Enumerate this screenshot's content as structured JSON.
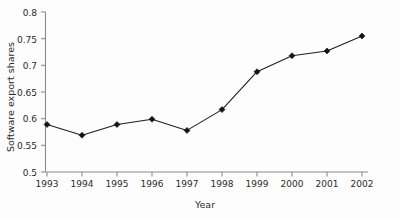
{
  "chart_data": {
    "type": "line",
    "title": "",
    "subtitle": "",
    "xlabel": "Year",
    "ylabel": "Software export shares",
    "x": [
      1993,
      1994,
      1995,
      1996,
      1997,
      1998,
      1999,
      2000,
      2001,
      2002
    ],
    "categories": [
      "1993",
      "1994",
      "1995",
      "1996",
      "1997",
      "1998",
      "1999",
      "2000",
      "2001",
      "2002"
    ],
    "values": [
      0.589,
      0.569,
      0.589,
      0.599,
      0.578,
      0.617,
      0.688,
      0.718,
      0.727,
      0.755
    ],
    "series": [
      {
        "name": "Software export shares",
        "values": [
          0.589,
          0.569,
          0.589,
          0.599,
          0.578,
          0.617,
          0.688,
          0.718,
          0.727,
          0.755
        ]
      }
    ],
    "ylim": [
      0.5,
      0.8
    ],
    "xlim": [
      1993,
      2002
    ],
    "ytick_labels": [
      "0.5",
      "0.55",
      "0.6",
      "0.65",
      "0.7",
      "0.75",
      "0.8"
    ],
    "ytick_values": [
      0.5,
      0.55,
      0.6,
      0.65,
      0.7,
      0.75,
      0.8
    ],
    "xtick_labels": [
      "1993",
      "1994",
      "1995",
      "1996",
      "1997",
      "1998",
      "1999",
      "2000",
      "2001",
      "2002"
    ],
    "grid": false,
    "legend": false,
    "legend_position": "none",
    "marker": "diamond",
    "line_color": "#1f1f1f",
    "marker_color": "#141414",
    "axis_color": "#8a8a8a",
    "background_color": "#fdfdfd",
    "annotations": []
  },
  "axis": {
    "y_label": "Software export shares",
    "x_label": "Year"
  }
}
